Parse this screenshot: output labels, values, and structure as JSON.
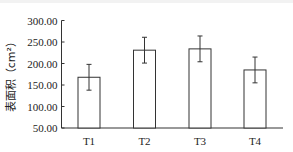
{
  "chart_data": {
    "type": "bar",
    "title": "",
    "xlabel": "",
    "ylabel": "表面积（cm²）",
    "categories": [
      "T1",
      "T2",
      "T3",
      "T4"
    ],
    "values": [
      168,
      231,
      234,
      185
    ],
    "error": [
      30,
      30,
      30,
      30
    ],
    "ylim": [
      50,
      300
    ],
    "yticks": [
      50,
      100,
      150,
      200,
      250,
      300
    ],
    "ytick_labels": [
      "50.00",
      "100.00",
      "150.00",
      "200.00",
      "250.00",
      "300.00"
    ],
    "grid": false,
    "legend": null,
    "bar_fill": "#ffffff",
    "bar_stroke": "#333333"
  }
}
